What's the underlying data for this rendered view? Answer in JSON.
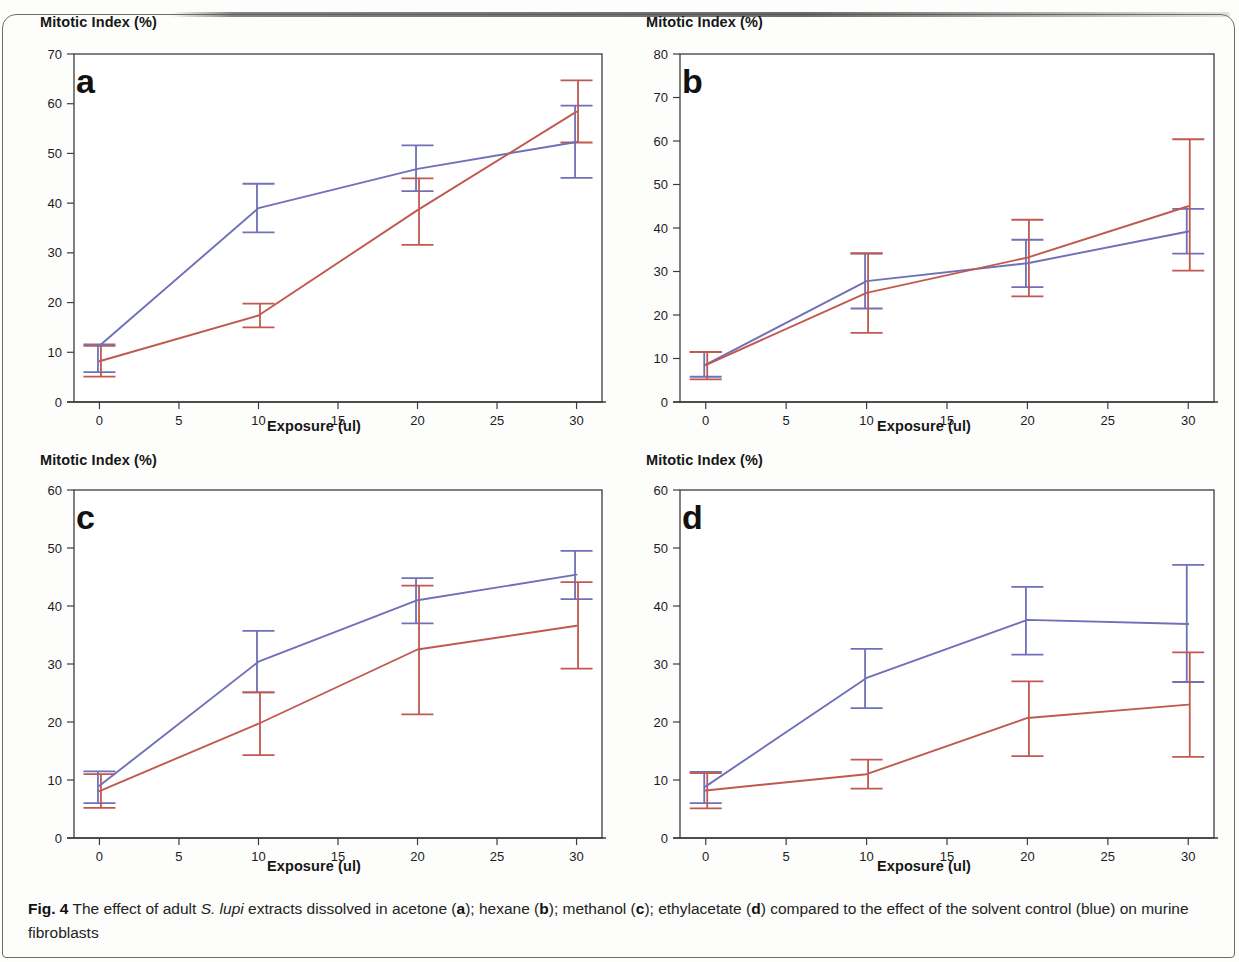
{
  "figure": {
    "label": "Fig. 4",
    "caption_part1": " The effect of adult ",
    "caption_species": "S. lupi",
    "caption_part2": " extracts dissolved in acetone (",
    "caption_a": "a",
    "caption_part3": "); hexane (",
    "caption_b": "b",
    "caption_part4": "); methanol (",
    "caption_c": "c",
    "caption_part5": "); ethylacetate (",
    "caption_d": "d",
    "caption_part6": ") compared to the effect of the solvent control (blue) on murine fibroblasts"
  },
  "colors": {
    "series_control": "#6f70b8",
    "series_extract": "#c0594f",
    "axis": "#3d3d3d",
    "text": "#1a1a1a"
  },
  "chart_data": [
    {
      "type": "line",
      "panel": "a",
      "title": "a",
      "solvent": "acetone",
      "xlabel": "Exposure (ul)",
      "ylabel": "Mitotic Index (%)",
      "x": [
        0,
        10,
        20,
        30
      ],
      "xticks": [
        0,
        5,
        10,
        15,
        20,
        25,
        30
      ],
      "yticks": [
        0,
        10,
        20,
        30,
        40,
        50,
        60,
        70
      ],
      "xlim": [
        -1.6,
        31.6
      ],
      "ylim": [
        0,
        70
      ],
      "grid": false,
      "legend": null,
      "series": [
        {
          "name": "solvent control",
          "color": "#6f70b8",
          "values": [
            11.3,
            39.0,
            46.9,
            52.3
          ],
          "err_low": [
            6.0,
            34.1,
            42.4,
            45.1
          ],
          "err_high": [
            11.6,
            43.9,
            51.6,
            59.6
          ]
        },
        {
          "name": "extract",
          "color": "#c0594f",
          "values": [
            8.2,
            17.4,
            38.6,
            58.4
          ],
          "err_low": [
            5.1,
            15.0,
            31.6,
            52.2
          ],
          "err_high": [
            11.3,
            19.8,
            45.0,
            64.7
          ]
        }
      ]
    },
    {
      "type": "line",
      "panel": "b",
      "title": "b",
      "solvent": "hexane",
      "xlabel": "Exposure (ul)",
      "ylabel": "Mitotic Index (%)",
      "x": [
        0,
        10,
        20,
        30
      ],
      "xticks": [
        0,
        5,
        10,
        15,
        20,
        25,
        30
      ],
      "yticks": [
        0,
        10,
        20,
        30,
        40,
        50,
        60,
        70,
        80
      ],
      "xlim": [
        -1.6,
        31.6
      ],
      "ylim": [
        0,
        80
      ],
      "grid": false,
      "legend": null,
      "series": [
        {
          "name": "solvent control",
          "color": "#6f70b8",
          "values": [
            8.6,
            27.8,
            31.9,
            39.2
          ],
          "err_low": [
            5.8,
            21.5,
            26.4,
            34.1
          ],
          "err_high": [
            11.5,
            34.1,
            37.3,
            44.4
          ]
        },
        {
          "name": "extract",
          "color": "#c0594f",
          "values": [
            8.5,
            25.1,
            33.2,
            45.0
          ],
          "err_low": [
            5.2,
            15.9,
            24.3,
            30.2
          ],
          "err_high": [
            11.5,
            34.2,
            41.9,
            60.4
          ]
        }
      ]
    },
    {
      "type": "line",
      "panel": "c",
      "title": "c",
      "solvent": "methanol",
      "xlabel": "Exposure (ul)",
      "ylabel": "Mitotic Index (%)",
      "x": [
        0,
        10,
        20,
        30
      ],
      "xticks": [
        0,
        5,
        10,
        15,
        20,
        25,
        30
      ],
      "yticks": [
        0,
        10,
        20,
        30,
        40,
        50,
        60
      ],
      "xlim": [
        -1.6,
        31.6
      ],
      "ylim": [
        0,
        60
      ],
      "grid": false,
      "legend": null,
      "series": [
        {
          "name": "solvent control",
          "color": "#6f70b8",
          "values": [
            9.0,
            30.4,
            41.0,
            45.4
          ],
          "err_low": [
            6.0,
            25.1,
            37.0,
            41.2
          ],
          "err_high": [
            11.5,
            35.7,
            44.8,
            49.5
          ]
        },
        {
          "name": "extract",
          "color": "#c0594f",
          "values": [
            8.1,
            19.7,
            32.5,
            36.6
          ],
          "err_low": [
            5.2,
            14.3,
            21.3,
            29.2
          ],
          "err_high": [
            11.0,
            25.1,
            43.5,
            44.1
          ]
        }
      ]
    },
    {
      "type": "line",
      "panel": "d",
      "title": "d",
      "solvent": "ethylacetate",
      "xlabel": "Exposure (ul)",
      "ylabel": "Mitotic Index (%)",
      "x": [
        0,
        10,
        20,
        30
      ],
      "xticks": [
        0,
        5,
        10,
        15,
        20,
        25,
        30
      ],
      "yticks": [
        0,
        10,
        20,
        30,
        40,
        50,
        60
      ],
      "xlim": [
        -1.6,
        31.6
      ],
      "ylim": [
        0,
        60
      ],
      "grid": false,
      "legend": null,
      "series": [
        {
          "name": "solvent control",
          "color": "#6f70b8",
          "values": [
            8.9,
            27.6,
            37.6,
            36.9
          ],
          "err_low": [
            6.0,
            22.4,
            31.6,
            26.9
          ],
          "err_high": [
            11.4,
            32.6,
            43.3,
            47.1
          ]
        },
        {
          "name": "extract",
          "color": "#c0594f",
          "values": [
            8.2,
            11.0,
            20.7,
            23.0
          ],
          "err_low": [
            5.1,
            8.5,
            14.1,
            14.0
          ],
          "err_high": [
            11.2,
            13.5,
            27.0,
            32.0
          ]
        }
      ]
    }
  ]
}
